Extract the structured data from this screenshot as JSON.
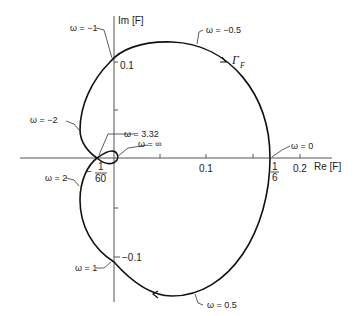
{
  "diagram": {
    "type": "nyquist-plot",
    "curve_name": "Γ_F",
    "axes": {
      "x_label": "Re [F]",
      "y_label": "Im [F]",
      "x_ticks": [
        {
          "label": "0.1",
          "value": 0.1
        },
        {
          "label": "0.2",
          "value": 0.2
        }
      ],
      "y_ticks": [
        {
          "label": "0.1",
          "value": 0.1
        },
        {
          "label": "−0.1",
          "value": -0.1
        }
      ]
    },
    "special_points": {
      "re_crossing_right": {
        "num": "1",
        "den": "6",
        "value": 0.1667
      },
      "re_crossing_left": {
        "sign": "−",
        "num": "1",
        "den": "60",
        "value": -0.0167
      }
    },
    "frequency_labels": [
      {
        "id": "w_neg_half",
        "text": "ω = −0.5"
      },
      {
        "id": "w_neg_1",
        "text": "ω = −1"
      },
      {
        "id": "w_neg_2",
        "text": "ω = −2"
      },
      {
        "id": "w_332",
        "text": "ω = 3.32"
      },
      {
        "id": "w_inf",
        "text": "ω = ∞"
      },
      {
        "id": "w_0",
        "text": "ω = 0"
      },
      {
        "id": "w_2",
        "text": "ω = 2"
      },
      {
        "id": "w_1",
        "text": "ω = 1"
      },
      {
        "id": "w_half",
        "text": "ω = 0.5"
      }
    ],
    "gamma": "Γ",
    "gamma_sub": "F",
    "colors": {
      "curve": "#111111",
      "axis": "#555555",
      "text": "#222222"
    }
  }
}
